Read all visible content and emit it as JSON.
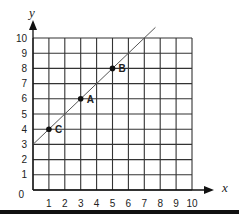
{
  "chart_data": {
    "type": "line",
    "title": "",
    "xlabel": "x",
    "ylabel": "y",
    "xlim": [
      0,
      10
    ],
    "ylim": [
      0,
      10
    ],
    "grid": true,
    "x_ticks": [
      1,
      2,
      3,
      4,
      5,
      6,
      7,
      8,
      9,
      10
    ],
    "y_ticks": [
      0,
      1,
      2,
      3,
      4,
      5,
      6,
      7,
      8,
      9,
      10
    ],
    "line": {
      "slope": 1,
      "intercept": 3,
      "x_range": [
        0,
        7.7
      ]
    },
    "points": [
      {
        "label": "C",
        "x": 1,
        "y": 4
      },
      {
        "label": "A",
        "x": 3,
        "y": 6
      },
      {
        "label": "B",
        "x": 5,
        "y": 8
      }
    ],
    "colors": {
      "grid": "#333333",
      "line": "#555555",
      "point": "#111111"
    }
  }
}
